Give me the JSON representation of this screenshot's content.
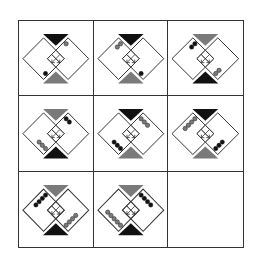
{
  "puzzle": {
    "rows": 3,
    "cols": 3,
    "colors": {
      "black": "#111111",
      "gray": "#7a7a7a",
      "line": "#333333",
      "background": "#ffffff"
    },
    "cells": [
      {
        "row": 1,
        "col": 1,
        "top_triangle": "black",
        "bottom_triangle": "gray",
        "dots_a": {
          "position": "upper-right",
          "count": 1,
          "color": "gray"
        },
        "dots_b": {
          "position": "lower-left",
          "count": 1,
          "color": "black"
        }
      },
      {
        "row": 1,
        "col": 2,
        "top_triangle": "black",
        "bottom_triangle": "gray",
        "dots_a": {
          "position": "upper-left",
          "count": 2,
          "color": "gray"
        },
        "dots_b": {
          "position": "lower-right",
          "count": 1,
          "color": "black"
        }
      },
      {
        "row": 1,
        "col": 3,
        "top_triangle": "gray",
        "bottom_triangle": "black",
        "dots_a": {
          "position": "upper-left",
          "count": 2,
          "color": "black"
        },
        "dots_b": {
          "position": "lower-right",
          "count": 2,
          "color": "gray"
        }
      },
      {
        "row": 2,
        "col": 1,
        "top_triangle": "gray",
        "bottom_triangle": "black",
        "dots_a": {
          "position": "upper-right",
          "count": 2,
          "color": "black"
        },
        "dots_b": {
          "position": "lower-left",
          "count": 3,
          "color": "gray"
        }
      },
      {
        "row": 2,
        "col": 2,
        "top_triangle": "black",
        "bottom_triangle": "gray",
        "dots_a": {
          "position": "upper-right",
          "count": 3,
          "color": "gray"
        },
        "dots_b": {
          "position": "lower-left",
          "count": 3,
          "color": "black"
        }
      },
      {
        "row": 2,
        "col": 3,
        "top_triangle": "black",
        "bottom_triangle": "gray",
        "dots_a": {
          "position": "upper-left",
          "count": 4,
          "color": "gray"
        },
        "dots_b": {
          "position": "lower-right",
          "count": 3,
          "color": "black"
        }
      },
      {
        "row": 3,
        "col": 1,
        "top_triangle": "gray",
        "bottom_triangle": "black",
        "dots_a": {
          "position": "upper-left",
          "count": 4,
          "color": "black"
        },
        "dots_b": {
          "position": "lower-right",
          "count": 4,
          "color": "gray"
        }
      },
      {
        "row": 3,
        "col": 2,
        "top_triangle": "gray",
        "bottom_triangle": "black",
        "dots_a": {
          "position": "upper-right",
          "count": 4,
          "color": "black"
        },
        "dots_b": {
          "position": "lower-left",
          "count": 5,
          "color": "gray"
        }
      },
      {
        "row": 3,
        "col": 3,
        "empty": true
      }
    ]
  }
}
